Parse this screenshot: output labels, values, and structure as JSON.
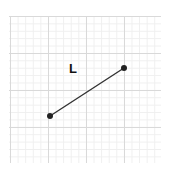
{
  "figure": {
    "type": "line-segment-on-grid",
    "grid": {
      "minor_color": "#efefef",
      "major_color": "#d9d9d9",
      "minor_divisions_per_major": 5
    },
    "segment": {
      "label": "L",
      "color": "#333333",
      "endpoints": [
        {
          "name": "left-endpoint",
          "x": 50,
          "y": 116
        },
        {
          "name": "right-endpoint",
          "x": 124,
          "y": 68
        }
      ]
    }
  }
}
